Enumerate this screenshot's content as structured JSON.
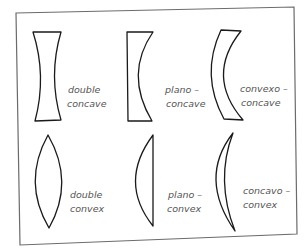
{
  "diagram": {
    "lenses": [
      {
        "id": "double-concave",
        "line1": "double",
        "line2": "concave"
      },
      {
        "id": "plano-concave",
        "line1": "plano –",
        "line2": "concave"
      },
      {
        "id": "convexo-concave",
        "line1": "convexo –",
        "line2": "concave"
      },
      {
        "id": "double-convex",
        "line1": "double",
        "line2": "convex"
      },
      {
        "id": "plano-convex",
        "line1": "plano –",
        "line2": "convex"
      },
      {
        "id": "concavo-convex",
        "line1": "concavo –",
        "line2": "convex"
      }
    ],
    "colors": {
      "stroke": "#1a1a1a",
      "label": "#555555",
      "frame": "#6b6b6b"
    }
  }
}
